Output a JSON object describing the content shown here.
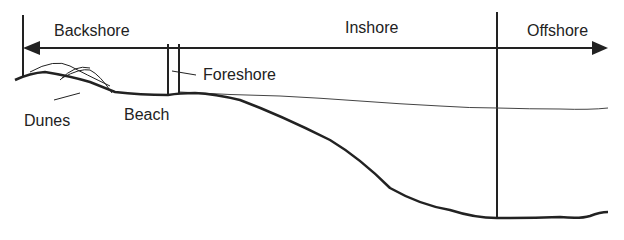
{
  "diagram": {
    "type": "coastal-profile",
    "zones": {
      "backshore": "Backshore",
      "inshore": "Inshore",
      "offshore": "Offshore",
      "foreshore": "Foreshore"
    },
    "features": {
      "dunes": "Dunes",
      "beach": "Beach"
    },
    "colors": {
      "line": "#222222",
      "background": "#ffffff"
    }
  }
}
